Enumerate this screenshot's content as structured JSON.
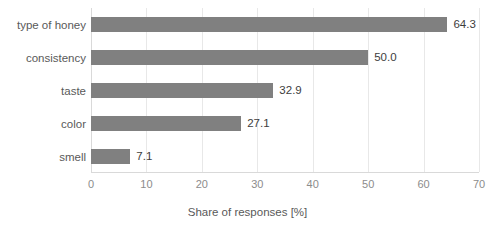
{
  "chart_data": {
    "type": "bar",
    "orientation": "horizontal",
    "title": "",
    "subtitle": "",
    "xlabel": "Share of responses [%]",
    "ylabel": "",
    "categories": [
      "type of honey",
      "consistency",
      "taste",
      "color",
      "smell"
    ],
    "values": [
      64.3,
      50.0,
      32.9,
      27.1,
      7.1
    ],
    "data_labels": [
      "64.3",
      "50.0",
      "32.9",
      "27.1",
      "7.1"
    ],
    "xlim": [
      0,
      70
    ],
    "ylim": null,
    "xticks": [
      0,
      10,
      20,
      30,
      40,
      50,
      60,
      70
    ],
    "xtick_labels": [
      "0",
      "10",
      "20",
      "30",
      "40",
      "50",
      "60",
      "70"
    ],
    "grid": "vertical",
    "legend": null,
    "legend_position": "none",
    "series": [
      {
        "name": "Share of responses",
        "values": [
          64.3,
          50.0,
          32.9,
          27.1,
          7.1
        ],
        "color": "#808080"
      }
    ],
    "colors": {
      "bar": "#808080",
      "gridline": "#e8e8e8",
      "axis": "#d9d9d9",
      "tick_text": "#8c8c8c",
      "label_text": "#595959",
      "value_text": "#3d3d3d",
      "background": "#ffffff"
    }
  }
}
